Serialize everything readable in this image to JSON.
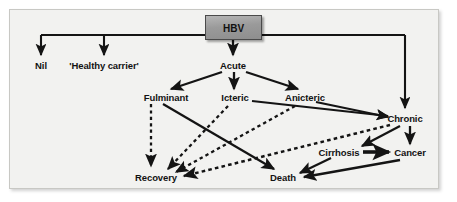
{
  "figure": {
    "frame": {
      "background_color": "#f2f2f0",
      "border_color": "#c8c8c4"
    }
  },
  "root_node": {
    "id": "hbv",
    "label": "HBV",
    "shape": "rectangle",
    "fill_color": "#9a9a9a",
    "border_color": "#4a4a4a",
    "text_color": "#111111"
  },
  "nodes": [
    {
      "id": "nil",
      "label": "Nil",
      "x": 41,
      "y": 65
    },
    {
      "id": "healthy-carrier",
      "label": "'Healthy carrier'",
      "x": 104,
      "y": 65
    },
    {
      "id": "acute",
      "label": "Acute",
      "x": 233,
      "y": 65
    },
    {
      "id": "fulminant",
      "label": "Fulminant",
      "x": 166,
      "y": 97
    },
    {
      "id": "icteric",
      "label": "Icteric",
      "x": 235,
      "y": 97
    },
    {
      "id": "anicteric",
      "label": "Anicteric",
      "x": 305,
      "y": 97
    },
    {
      "id": "chronic",
      "label": "Chronic",
      "x": 405,
      "y": 118
    },
    {
      "id": "cirrhosis",
      "label": "Cirrhosis",
      "x": 339,
      "y": 152
    },
    {
      "id": "cancer",
      "label": "Cancer",
      "x": 410,
      "y": 152
    },
    {
      "id": "recovery",
      "label": "Recovery",
      "x": 156,
      "y": 177
    },
    {
      "id": "death",
      "label": "Death",
      "x": 283,
      "y": 177
    }
  ],
  "edges": [
    {
      "id": "hbv-nil",
      "from": "hbv",
      "to": "nil",
      "style": "solid",
      "arrow": true
    },
    {
      "id": "hbv-healthy-carrier",
      "from": "hbv",
      "to": "healthy-carrier",
      "style": "solid",
      "arrow": true
    },
    {
      "id": "hbv-acute",
      "from": "hbv",
      "to": "acute",
      "style": "solid",
      "arrow": true
    },
    {
      "id": "hbv-chronic",
      "from": "hbv",
      "to": "chronic",
      "style": "solid",
      "arrow": true
    },
    {
      "id": "acute-fulminant",
      "from": "acute",
      "to": "fulminant",
      "style": "solid",
      "arrow": true
    },
    {
      "id": "acute-icteric",
      "from": "acute",
      "to": "icteric",
      "style": "solid",
      "arrow": true
    },
    {
      "id": "acute-anicteric",
      "from": "acute",
      "to": "anicteric",
      "style": "solid",
      "arrow": true
    },
    {
      "id": "icteric-chronic",
      "from": "icteric",
      "to": "chronic",
      "style": "solid",
      "arrow": true
    },
    {
      "id": "anicteric-chronic",
      "from": "anicteric",
      "to": "chronic",
      "style": "solid",
      "arrow": true
    },
    {
      "id": "fulminant-recovery",
      "from": "fulminant",
      "to": "recovery",
      "style": "dashed",
      "arrow": true
    },
    {
      "id": "fulminant-death",
      "from": "fulminant",
      "to": "death",
      "style": "solid",
      "arrow": true
    },
    {
      "id": "icteric-recovery",
      "from": "icteric",
      "to": "recovery",
      "style": "dashed",
      "arrow": true
    },
    {
      "id": "anicteric-recovery",
      "from": "anicteric",
      "to": "recovery",
      "style": "dashed",
      "arrow": true
    },
    {
      "id": "chronic-recovery",
      "from": "chronic",
      "to": "recovery",
      "style": "dashed",
      "arrow": true
    },
    {
      "id": "chronic-cirrhosis",
      "from": "chronic",
      "to": "cirrhosis",
      "style": "solid",
      "arrow": true
    },
    {
      "id": "chronic-cancer",
      "from": "chronic",
      "to": "cancer",
      "style": "solid",
      "arrow": true
    },
    {
      "id": "cirrhosis-cancer",
      "from": "cirrhosis",
      "to": "cancer",
      "style": "solid",
      "arrow": true
    },
    {
      "id": "cirrhosis-death",
      "from": "cirrhosis",
      "to": "death",
      "style": "solid",
      "arrow": true
    },
    {
      "id": "cancer-death",
      "from": "cancer",
      "to": "death",
      "style": "solid",
      "arrow": true
    }
  ],
  "style": {
    "line_color": "#141414",
    "text_color": "#131313"
  }
}
